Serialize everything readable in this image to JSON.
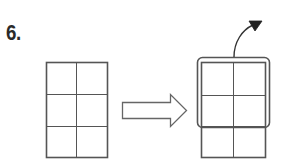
{
  "step": {
    "number_label": "6."
  },
  "diagram": {
    "left_grid": {
      "columns": 2,
      "rows": 3
    },
    "transform_arrow": {
      "direction": "right",
      "style": "outline"
    },
    "right_grid": {
      "columns": 2,
      "rows": 3,
      "highlighted_rows": 2
    },
    "fold_arrow": {
      "direction": "up-right",
      "style": "curved"
    },
    "colors": {
      "line": "#555555",
      "arrow_fill": "#222222",
      "background": "#ffffff"
    }
  }
}
